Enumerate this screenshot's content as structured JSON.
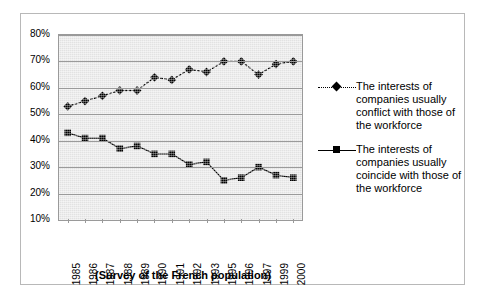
{
  "chart_data": {
    "type": "line",
    "title": "",
    "subtitle": "",
    "xlabel": "(Survey of the French population)",
    "ylabel": "",
    "categories": [
      "1985",
      "1986",
      "1987",
      "1988",
      "1989",
      "1990",
      "1991",
      "1992",
      "1993",
      "1995",
      "1996",
      "1997",
      "1999",
      "2000"
    ],
    "ylim": [
      10,
      80
    ],
    "ytick_labels": [
      "80%",
      "70%",
      "60%",
      "50%",
      "40%",
      "30%",
      "20%",
      "10%"
    ],
    "ytick_values": [
      80,
      70,
      60,
      50,
      40,
      30,
      20,
      10
    ],
    "ytick_step": 10,
    "grid": true,
    "legend_position": "right",
    "series": [
      {
        "name": "The interests of companies usually conflict with those of the workforce",
        "marker": "diamond",
        "linestyle": "dotted",
        "color": "#000000",
        "values": [
          53,
          55,
          57,
          59,
          59,
          64,
          63,
          67,
          66,
          70,
          70,
          65,
          69,
          70
        ]
      },
      {
        "name": "The interests of companies usually coincide with those of the workforce",
        "marker": "square",
        "linestyle": "solid",
        "color": "#000000",
        "values": [
          43,
          41,
          41,
          37,
          38,
          35,
          35,
          31,
          32,
          25,
          26,
          30,
          27,
          26
        ]
      }
    ]
  },
  "legend": {
    "items": [
      {
        "label": "The interests of companies usually conflict with those of the workforce",
        "marker": "diamond",
        "linestyle": "dotted"
      },
      {
        "label": "The interests of companies usually coincide with those of the workforce",
        "marker": "square",
        "linestyle": "solid"
      }
    ]
  },
  "caption": "(Survey of the French population)",
  "colors": {
    "plot_background": "#e9e9e9",
    "gridline": "#9a9a9a",
    "series": "#000000",
    "figure_border": "#b8b8b8"
  }
}
